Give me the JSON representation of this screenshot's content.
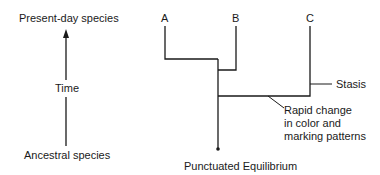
{
  "time_axis": {
    "top_label": "Present-day species",
    "middle_label": "Time",
    "bottom_label": "Ancestral species"
  },
  "tree": {
    "species": [
      {
        "label": "A"
      },
      {
        "label": "B"
      },
      {
        "label": "C"
      }
    ],
    "annotations": {
      "stasis": "Stasis",
      "rapid_line1": "Rapid change",
      "rapid_line2": "in color and",
      "rapid_line3": "marking patterns"
    },
    "title": "Punctuated Equilibrium"
  },
  "colors": {
    "line": "#1a1a1a",
    "background": "#ffffff"
  }
}
